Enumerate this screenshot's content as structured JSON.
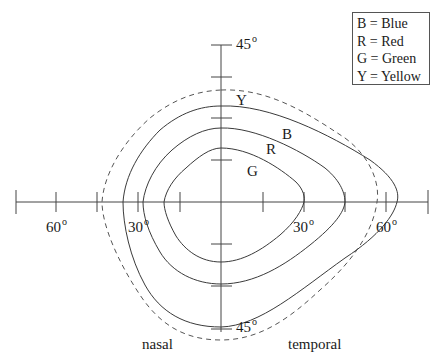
{
  "legend": {
    "items": [
      {
        "key": "B",
        "label": "B = Blue"
      },
      {
        "key": "R",
        "label": "R = Red"
      },
      {
        "key": "G",
        "label": "G = Green"
      },
      {
        "key": "Y",
        "label": "Y = Yellow"
      }
    ]
  },
  "axes": {
    "top_label": "45",
    "bottom_label": "45",
    "left_60": "60",
    "left_30": "30",
    "right_30": "30",
    "right_60": "60",
    "degree_symbol": "o"
  },
  "curve_labels": {
    "yellow": "Y",
    "blue": "B",
    "red": "R",
    "green": "G"
  },
  "regions": {
    "nasal": "nasal",
    "temporal": "temporal"
  },
  "colors": {
    "line": "#3a3a3a",
    "dashed": "#555555"
  }
}
